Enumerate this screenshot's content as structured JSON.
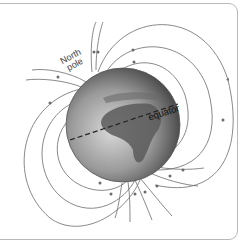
{
  "diagram": {
    "labels": {
      "north_pole_line1": "North",
      "north_pole_line2": "pole",
      "equator": "equator"
    },
    "colors": {
      "field_lines": "#6b6b6b",
      "frame": "#b9b9b9",
      "globe_dark": "#4a4a4a",
      "globe_light": "#c8c8c8"
    }
  }
}
